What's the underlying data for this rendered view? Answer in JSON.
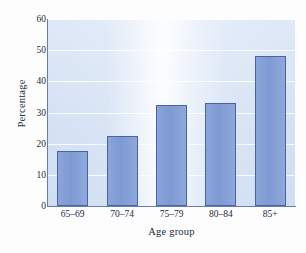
{
  "chart_data": {
    "type": "bar",
    "title": "",
    "xlabel": "Age group",
    "ylabel": "Percentage",
    "categories": [
      "65–69",
      "70–74",
      "75–79",
      "80–84",
      "85+"
    ],
    "values": [
      17.8,
      22.4,
      32.5,
      33.2,
      48.2
    ],
    "ylim": [
      0,
      60
    ],
    "yticks": [
      0,
      10,
      20,
      30,
      40,
      50,
      60
    ],
    "ytick_labels": [
      "0",
      "10",
      "20",
      "30",
      "40",
      "50",
      "60"
    ],
    "grid": true,
    "grid_axis": "y",
    "legend": false,
    "legend_position": "none",
    "series": [
      {
        "name": "Percentage",
        "values": [
          17.8,
          22.4,
          32.5,
          33.2,
          48.2
        ]
      }
    ],
    "colors": {
      "bar_fill": "#7e9ad4",
      "bar_edge": "#4a63a8",
      "plot_background": "#d5e2f4",
      "gridline": "#ffffff",
      "axis": "#6a7da6",
      "text": "#222c44",
      "figure_background": "#fdfdfd"
    }
  }
}
